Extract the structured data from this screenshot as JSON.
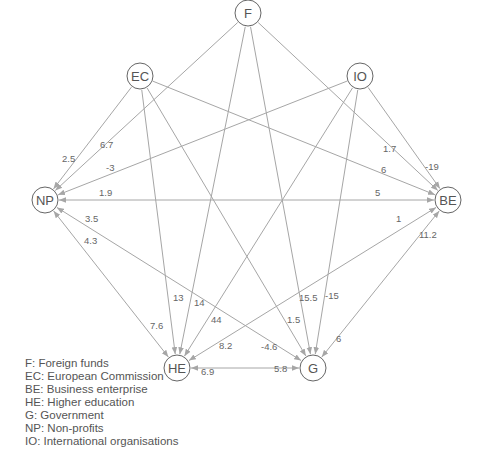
{
  "diagram": {
    "nodes": [
      {
        "id": "F",
        "label": "F",
        "x": 248,
        "y": 13,
        "r": 13
      },
      {
        "id": "EC",
        "label": "EC",
        "x": 140,
        "y": 76,
        "r": 13
      },
      {
        "id": "IO",
        "label": "IO",
        "x": 360,
        "y": 76,
        "r": 13
      },
      {
        "id": "NP",
        "label": "NP",
        "x": 45,
        "y": 200,
        "r": 13
      },
      {
        "id": "BE",
        "label": "BE",
        "x": 448,
        "y": 200,
        "r": 13
      },
      {
        "id": "HE",
        "label": "HE",
        "x": 177,
        "y": 368,
        "r": 13
      },
      {
        "id": "G",
        "label": "G",
        "x": 313,
        "y": 368,
        "r": 13
      }
    ],
    "edges": [
      {
        "from": "EC",
        "to": "NP",
        "bidirectional": false,
        "labels": [
          {
            "text": "2.5",
            "x": 62,
            "y": 162
          }
        ]
      },
      {
        "from": "F",
        "to": "NP",
        "bidirectional": false,
        "labels": [
          {
            "text": "6.7",
            "x": 100,
            "y": 148
          }
        ]
      },
      {
        "from": "IO",
        "to": "NP",
        "bidirectional": false,
        "labels": [
          {
            "text": "-3",
            "x": 106,
            "y": 171
          }
        ]
      },
      {
        "from": "EC",
        "to": "BE",
        "bidirectional": false,
        "labels": [
          {
            "text": "6",
            "x": 381,
            "y": 173
          }
        ]
      },
      {
        "from": "F",
        "to": "BE",
        "bidirectional": false,
        "labels": [
          {
            "text": "1.7",
            "x": 383,
            "y": 152
          }
        ]
      },
      {
        "from": "IO",
        "to": "BE",
        "bidirectional": false,
        "labels": [
          {
            "text": "-19",
            "x": 425,
            "y": 170
          }
        ]
      },
      {
        "from": "EC",
        "to": "HE",
        "bidirectional": false,
        "labels": [
          {
            "text": "13",
            "x": 173,
            "y": 301
          }
        ]
      },
      {
        "from": "F",
        "to": "HE",
        "bidirectional": false,
        "labels": [
          {
            "text": "14",
            "x": 194,
            "y": 306
          }
        ]
      },
      {
        "from": "IO",
        "to": "HE",
        "bidirectional": false,
        "labels": [
          {
            "text": "44",
            "x": 211,
            "y": 323
          }
        ]
      },
      {
        "from": "EC",
        "to": "G",
        "bidirectional": false,
        "labels": [
          {
            "text": "1.5",
            "x": 287,
            "y": 323
          }
        ]
      },
      {
        "from": "F",
        "to": "G",
        "bidirectional": false,
        "labels": [
          {
            "text": "15.5",
            "x": 299,
            "y": 301
          }
        ]
      },
      {
        "from": "IO",
        "to": "G",
        "bidirectional": false,
        "labels": [
          {
            "text": "-15",
            "x": 325,
            "y": 299
          }
        ]
      },
      {
        "from": "NP",
        "to": "BE",
        "bidirectional": true,
        "labels": [
          {
            "text": "1.9",
            "x": 99,
            "y": 196
          },
          {
            "text": "5",
            "x": 375,
            "y": 196
          }
        ]
      },
      {
        "from": "NP",
        "to": "G",
        "bidirectional": true,
        "labels": [
          {
            "text": "3.5",
            "x": 85,
            "y": 222
          },
          {
            "text": "-4.6",
            "x": 261,
            "y": 350
          }
        ]
      },
      {
        "from": "NP",
        "to": "HE",
        "bidirectional": true,
        "labels": [
          {
            "text": "4.3",
            "x": 84,
            "y": 244
          },
          {
            "text": "7.6",
            "x": 150,
            "y": 329
          }
        ]
      },
      {
        "from": "BE",
        "to": "HE",
        "bidirectional": true,
        "labels": [
          {
            "text": "1",
            "x": 396,
            "y": 222
          },
          {
            "text": "8.2",
            "x": 219,
            "y": 349
          }
        ]
      },
      {
        "from": "BE",
        "to": "G",
        "bidirectional": true,
        "labels": [
          {
            "text": "11.2",
            "x": 419,
            "y": 238
          },
          {
            "text": "6",
            "x": 336,
            "y": 342
          }
        ]
      },
      {
        "from": "HE",
        "to": "G",
        "bidirectional": true,
        "labels": [
          {
            "text": "6.9",
            "x": 201,
            "y": 375
          },
          {
            "text": "5.8",
            "x": 274,
            "y": 372
          }
        ]
      }
    ],
    "style": {
      "edge_color": "#a6a6a6",
      "node_stroke": "#666666",
      "text_color": "#555555"
    }
  },
  "legend": {
    "items": [
      "F: Foreign funds",
      "EC: European Commission",
      "BE: Business enterprise",
      "HE: Higher education",
      "G: Government",
      "NP: Non-profits",
      "IO: International organisations"
    ]
  }
}
